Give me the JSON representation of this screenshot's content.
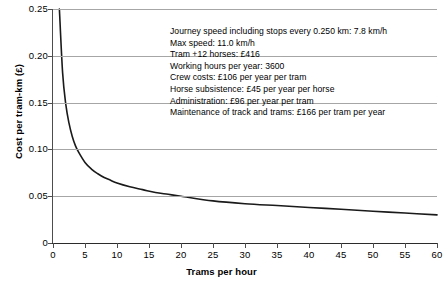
{
  "chart_data": {
    "type": "line",
    "title": "",
    "xlabel": "Trams per hour",
    "ylabel": "Cost per tram-km (£)",
    "xlim": [
      0,
      60
    ],
    "ylim": [
      0,
      0.25
    ],
    "grid": true,
    "legend": false,
    "xticks": [
      "0",
      "5",
      "10",
      "15",
      "20",
      "25",
      "30",
      "35",
      "40",
      "45",
      "50",
      "55",
      "60"
    ],
    "xtick_values": [
      0,
      5,
      10,
      15,
      20,
      25,
      30,
      35,
      40,
      45,
      50,
      55,
      60
    ],
    "yticks": [
      "0",
      "0.05",
      "0.10",
      "0.15",
      "0.20",
      "0.25"
    ],
    "ytick_values": [
      0,
      0.05,
      0.1,
      0.15,
      0.2,
      0.25
    ],
    "series": [
      {
        "name": "Cost per tram-km",
        "x": [
          1.0,
          1.5,
          2,
          2.5,
          3,
          3.5,
          4,
          5,
          6,
          7,
          8,
          9,
          10,
          12,
          14,
          16,
          18,
          20,
          25,
          30,
          35,
          40,
          45,
          50,
          55,
          60
        ],
        "y": [
          0.25,
          0.182,
          0.148,
          0.128,
          0.114,
          0.104,
          0.097,
          0.086,
          0.079,
          0.074,
          0.07,
          0.067,
          0.064,
          0.06,
          0.057,
          0.054,
          0.052,
          0.05,
          0.045,
          0.042,
          0.04,
          0.038,
          0.036,
          0.034,
          0.032,
          0.03
        ]
      }
    ],
    "annotations": [
      "Journey speed including stops every 0.250 km: 7.8 km/h",
      "Max speed: 11.0 km/h",
      "Tram +12 horses: £416",
      "Working hours per year: 3600",
      "Crew costs: £106 per year per tram",
      "Horse subsistence: £45 per year per horse",
      "Administration: £96 per year per tram",
      "Maintenance of track and trams: £166 per tram per year"
    ]
  },
  "colors": {
    "curve": "#1a1a1a",
    "grid": "#a6a6a6",
    "axis": "#333333",
    "background": "#ffffff"
  }
}
